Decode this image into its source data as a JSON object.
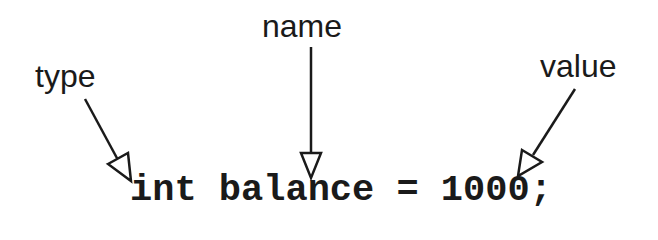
{
  "diagram": {
    "code_statement": "int balance = 1000;",
    "labels": {
      "type": "type",
      "name": "name",
      "value": "value"
    },
    "annotations": [
      {
        "label": "type",
        "points_to": "int"
      },
      {
        "label": "name",
        "points_to": "balance"
      },
      {
        "label": "value",
        "points_to": "1000"
      }
    ],
    "colors": {
      "ink": "#1a1a1a",
      "background": "#ffffff"
    }
  }
}
